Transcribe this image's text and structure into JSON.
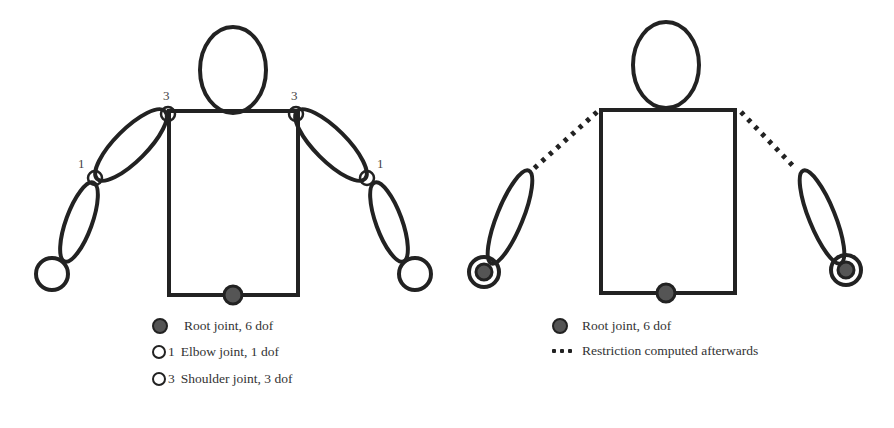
{
  "left_figure": {
    "labels": {
      "shoulder_left": "3",
      "shoulder_right": "3",
      "elbow_left": "1",
      "elbow_right": "1"
    },
    "legend": [
      {
        "icon": "filled-circle-icon",
        "label": "Root joint, 6 dof"
      },
      {
        "icon": "open-circle-icon",
        "number": "1",
        "label": "Elbow joint, 1 dof"
      },
      {
        "icon": "open-circle-icon",
        "number": "3",
        "label": "Shoulder joint, 3 dof"
      }
    ]
  },
  "right_figure": {
    "legend": [
      {
        "icon": "filled-circle-icon",
        "label": "Root joint, 6 dof"
      },
      {
        "icon": "dotted-line-icon",
        "label": "Restriction computed afterwards"
      }
    ]
  },
  "colors": {
    "stroke": "#222222",
    "joint_fill": "#555555",
    "text": "#333333"
  }
}
